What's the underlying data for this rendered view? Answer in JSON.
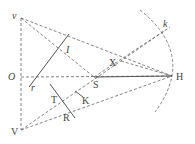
{
  "figure": {
    "colors": {
      "line": "#555555",
      "dashed": "#666666",
      "text": "#444444"
    },
    "labels": {
      "v": "v",
      "O": "O",
      "V": "V",
      "H": "H",
      "k": "k",
      "X": "X",
      "S": "S",
      "I": "I",
      "r": "r",
      "T": "T",
      "K": "K",
      "R": "R"
    },
    "points": {
      "v": [
        21,
        18
      ],
      "O": [
        21,
        77
      ],
      "V": [
        21,
        130
      ],
      "H": [
        172,
        76
      ],
      "k": [
        164,
        31
      ],
      "X": [
        121,
        61
      ],
      "S": [
        94,
        77
      ],
      "I": [
        64,
        52
      ],
      "T": [
        61,
        98
      ],
      "K": [
        80,
        94
      ],
      "R": [
        68,
        111
      ]
    }
  }
}
